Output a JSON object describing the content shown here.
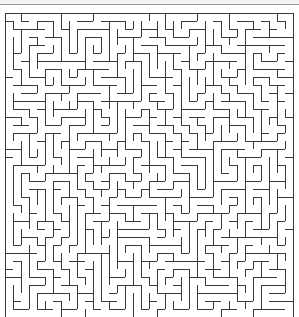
{
  "maze": {
    "cols": 36,
    "rows": 38,
    "cell_px": 8,
    "origin_x": 5,
    "origin_y": 13,
    "wall_color": "#3a3a3a",
    "background_color": "#ffffff",
    "seed": 20240
  }
}
